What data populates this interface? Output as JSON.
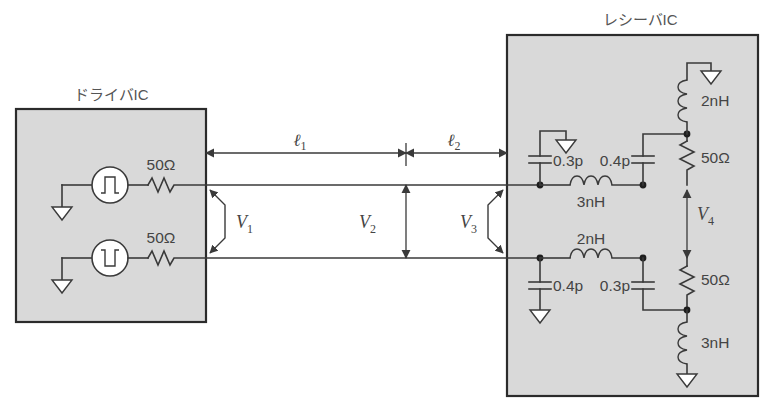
{
  "figure": {
    "type": "circuit-schematic"
  },
  "blocks": {
    "driver": {
      "title": "ドライバIC",
      "sources": [
        {
          "name": "pulse-source-noninverted",
          "waveform": "positive-pulse"
        },
        {
          "name": "pulse-source-inverted",
          "waveform": "negative-pulse"
        }
      ],
      "resistors": [
        {
          "value": "50Ω"
        },
        {
          "value": "50Ω"
        }
      ]
    },
    "receiver": {
      "title": "レシーバIC",
      "top_branch": {
        "cap_in": "0.3p",
        "series_inductor": "3nH",
        "cap_out": "0.4p",
        "supply_inductor": "2nH",
        "termination": "50Ω"
      },
      "bottom_branch": {
        "cap_in": "0.4p",
        "series_inductor": "2nH",
        "cap_out": "0.3p",
        "termination": "50Ω",
        "ground_inductor": "3nH"
      }
    }
  },
  "dimensions": [
    {
      "id": "l1",
      "symbol": "ℓ",
      "subscript": "1"
    },
    {
      "id": "l2",
      "symbol": "ℓ",
      "subscript": "2"
    }
  ],
  "voltages": [
    {
      "id": "v1",
      "symbol": "V",
      "subscript": "1"
    },
    {
      "id": "v2",
      "symbol": "V",
      "subscript": "2"
    },
    {
      "id": "v3",
      "symbol": "V",
      "subscript": "3"
    },
    {
      "id": "v4",
      "symbol": "V",
      "subscript": "4"
    }
  ],
  "colors": {
    "ic_fill": "#d9d9d9",
    "ic_border": "#2b2b2b",
    "wire": "#3a3a3a",
    "text": "#444444",
    "background": "#ffffff"
  }
}
